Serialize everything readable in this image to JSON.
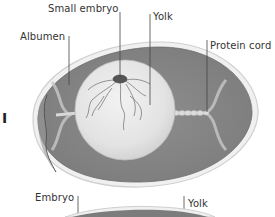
{
  "diagram": {
    "stage_label": "I",
    "labels": {
      "small_embryo": "Small embryo",
      "yolk_top": "Yolk",
      "albumen": "Albumen",
      "protein_cord": "Protein cord",
      "embryo": "Embryo",
      "yolk_bottom": "Yolk"
    },
    "colors": {
      "albumen": "#8a8a8a",
      "shell": "#e6e6e6",
      "yolk": "#ececec",
      "cord": "#d8d8d8",
      "embryo": "#555555",
      "leader_line": "#444444"
    }
  }
}
